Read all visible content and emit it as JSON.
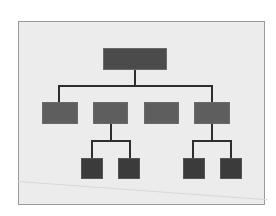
{
  "diagram": {
    "type": "org-chart",
    "colors": {
      "background": "#ececec",
      "frame_border": "#9a9a9a",
      "root_fill": "#4b4b4b",
      "level1_fill": "#5e5e5e",
      "level2_fill": "#3b3b3b",
      "connector": "#2e2e2e"
    },
    "nodes": [
      {
        "id": "root",
        "level": 0,
        "label": "",
        "x": 103,
        "y": 48,
        "w": 64,
        "h": 22
      },
      {
        "id": "child-1",
        "level": 1,
        "parent": "root",
        "label": "",
        "x": 42,
        "y": 102,
        "w": 36,
        "h": 22
      },
      {
        "id": "child-2",
        "level": 1,
        "parent": "root",
        "label": "",
        "x": 93,
        "y": 102,
        "w": 35,
        "h": 22
      },
      {
        "id": "child-3",
        "level": 1,
        "parent": "root",
        "label": "",
        "x": 144,
        "y": 102,
        "w": 35,
        "h": 22
      },
      {
        "id": "child-4",
        "level": 1,
        "parent": "root",
        "label": "",
        "x": 194,
        "y": 102,
        "w": 36,
        "h": 22
      },
      {
        "id": "grandchild-2a",
        "level": 2,
        "parent": "child-2",
        "label": "",
        "x": 81,
        "y": 158,
        "w": 22,
        "h": 21
      },
      {
        "id": "grandchild-2b",
        "level": 2,
        "parent": "child-2",
        "label": "",
        "x": 118,
        "y": 158,
        "w": 22,
        "h": 21
      },
      {
        "id": "grandchild-4a",
        "level": 2,
        "parent": "child-4",
        "label": "",
        "x": 183,
        "y": 158,
        "w": 22,
        "h": 21
      },
      {
        "id": "grandchild-4b",
        "level": 2,
        "parent": "child-4",
        "label": "",
        "x": 220,
        "y": 158,
        "w": 22,
        "h": 21
      }
    ],
    "edges": [
      {
        "from": "root",
        "to": "child-1"
      },
      {
        "from": "root",
        "to": "child-2"
      },
      {
        "from": "root",
        "to": "child-3"
      },
      {
        "from": "root",
        "to": "child-4"
      },
      {
        "from": "child-2",
        "to": "grandchild-2a"
      },
      {
        "from": "child-2",
        "to": "grandchild-2b"
      },
      {
        "from": "child-4",
        "to": "grandchild-4a"
      },
      {
        "from": "child-4",
        "to": "grandchild-4b"
      }
    ]
  }
}
